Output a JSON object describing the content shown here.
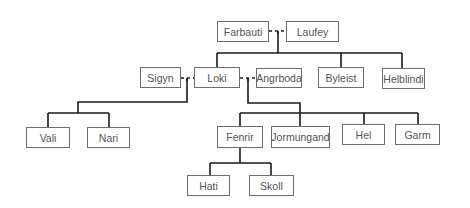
{
  "diagram": {
    "type": "family-tree",
    "line_color": "#1a1a1a",
    "box_border_color": "#6e6e6e",
    "text_color": "#555555",
    "nodes": [
      {
        "id": "farbauti",
        "label": "Farbauti",
        "x": 217,
        "y": 21,
        "w": 52,
        "h": 21
      },
      {
        "id": "laufey",
        "label": "Laufey",
        "x": 286,
        "y": 21,
        "w": 53,
        "h": 21
      },
      {
        "id": "sigyn",
        "label": "Sigyn",
        "x": 140,
        "y": 67,
        "w": 41,
        "h": 21
      },
      {
        "id": "loki",
        "label": "Loki",
        "x": 194,
        "y": 67,
        "w": 46,
        "h": 21
      },
      {
        "id": "angrboda",
        "label": "Angrboda",
        "x": 256,
        "y": 68,
        "w": 46,
        "h": 20
      },
      {
        "id": "byleist",
        "label": "Byleist",
        "x": 318,
        "y": 67,
        "w": 46,
        "h": 21
      },
      {
        "id": "helblindi",
        "label": "Helblindi",
        "x": 382,
        "y": 68,
        "w": 43,
        "h": 21
      },
      {
        "id": "vali",
        "label": "Vali",
        "x": 26,
        "y": 127,
        "w": 44,
        "h": 21
      },
      {
        "id": "nari",
        "label": "Nari",
        "x": 87,
        "y": 127,
        "w": 43,
        "h": 21
      },
      {
        "id": "fenrir",
        "label": "Fenrir",
        "x": 217,
        "y": 126,
        "w": 46,
        "h": 22
      },
      {
        "id": "jormungand",
        "label": "Jormungand",
        "x": 271,
        "y": 126,
        "w": 59,
        "h": 22
      },
      {
        "id": "hel",
        "label": "Hel",
        "x": 342,
        "y": 124,
        "w": 43,
        "h": 21
      },
      {
        "id": "garm",
        "label": "Garm",
        "x": 395,
        "y": 124,
        "w": 45,
        "h": 21
      },
      {
        "id": "hati",
        "label": "Hati",
        "x": 187,
        "y": 175,
        "w": 43,
        "h": 21
      },
      {
        "id": "skoll",
        "label": "Skoll",
        "x": 249,
        "y": 175,
        "w": 45,
        "h": 21
      }
    ],
    "marriages": [
      {
        "partners": [
          "farbauti",
          "laufey"
        ],
        "x1": 269,
        "x2": 286,
        "y": 31,
        "drop_x": 278
      },
      {
        "partners": [
          "sigyn",
          "loki"
        ],
        "x1": 181,
        "x2": 194,
        "y": 78,
        "drop_x": 187
      },
      {
        "partners": [
          "loki",
          "angrboda"
        ],
        "x1": 240,
        "x2": 256,
        "y": 78,
        "drop_x": 248
      }
    ],
    "family_lines": [
      "M278 31 V53 M217 53 H402 M217 53 V67 M341 53 V67 M402 53 V68",
      "M187 78 V102 H78 V113 M48 113 H109 M48 113 V127 M109 113 V127",
      "M248 78 V103 H300 V113 M240 113 H418 M240 113 V126 M300 113 V126 M364 113 V124 M418 113 V124",
      "M240 148 V163 M210 163 H271 M210 163 V175 M271 163 V175"
    ]
  }
}
